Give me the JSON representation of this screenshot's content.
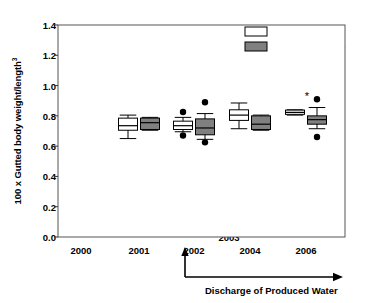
{
  "chart_data": {
    "type": "box",
    "title": "",
    "xlabel": "",
    "ylabel": "100 x Gutted body weight/length",
    "ylabel_sup": "3",
    "ylim": [
      0.0,
      1.4
    ],
    "yticks": [
      "0.0",
      "0.2",
      "0.4",
      "0.6",
      "0.8",
      "1.0",
      "1.2",
      "1.4"
    ],
    "ytick_values": [
      0.0,
      0.2,
      0.4,
      0.6,
      0.8,
      1.0,
      1.2,
      1.4
    ],
    "categories": [
      "2000",
      "2001",
      "2002",
      "2003",
      "2004",
      "2006"
    ],
    "grid": false,
    "legend_position": "top-right",
    "legend": [
      {
        "label": "Reference site",
        "fill": "#ffffff",
        "stroke": "#000000"
      },
      {
        "label": "Development site",
        "fill": "#808080",
        "stroke": "#000000"
      }
    ],
    "series": [
      {
        "name": "Reference site",
        "fill": "#ffffff",
        "boxes": [
          {
            "category": "2000",
            "present": false
          },
          {
            "category": "2001",
            "present": true,
            "whisker_low": 0.65,
            "q1": 0.705,
            "median": 0.735,
            "q3": 0.785,
            "whisker_high": 0.805,
            "outliers": []
          },
          {
            "category": "2002",
            "present": true,
            "whisker_low": 0.695,
            "q1": 0.71,
            "median": 0.735,
            "q3": 0.765,
            "whisker_high": 0.79,
            "outliers": [
              0.825,
              0.67
            ]
          },
          {
            "category": "2004",
            "present": true,
            "whisker_low": 0.715,
            "q1": 0.77,
            "median": 0.805,
            "q3": 0.84,
            "whisker_high": 0.885,
            "outliers": []
          },
          {
            "category": "2006",
            "present": true,
            "whisker_low": 0.805,
            "q1": 0.81,
            "median": 0.823,
            "q3": 0.838,
            "whisker_high": 0.84,
            "outliers": [],
            "significance_marker": "*"
          }
        ]
      },
      {
        "name": "Development site",
        "fill": "#808080",
        "boxes": [
          {
            "category": "2000",
            "present": false
          },
          {
            "category": "2001",
            "present": true,
            "whisker_low": 0.705,
            "q1": 0.71,
            "median": 0.755,
            "q3": 0.785,
            "whisker_high": 0.79,
            "outliers": []
          },
          {
            "category": "2002",
            "present": true,
            "whisker_low": 0.645,
            "q1": 0.675,
            "median": 0.72,
            "q3": 0.78,
            "whisker_high": 0.815,
            "outliers": [
              0.89,
              0.625
            ]
          },
          {
            "category": "2004",
            "present": true,
            "whisker_low": 0.705,
            "q1": 0.71,
            "median": 0.745,
            "q3": 0.8,
            "whisker_high": 0.805,
            "outliers": []
          },
          {
            "category": "2006",
            "present": true,
            "whisker_low": 0.715,
            "q1": 0.745,
            "median": 0.775,
            "q3": 0.8,
            "whisker_high": 0.855,
            "outliers": [
              0.91,
              0.66
            ]
          }
        ]
      }
    ],
    "annotations": [
      {
        "name": "discharge-arrow-label",
        "text": "Discharge of Produced Water"
      },
      {
        "name": "discharge-start-year",
        "text": "2003"
      }
    ]
  },
  "axis": {
    "y_label_text": "100 x Gutted body weight/length",
    "y_label_exponent": "3"
  }
}
